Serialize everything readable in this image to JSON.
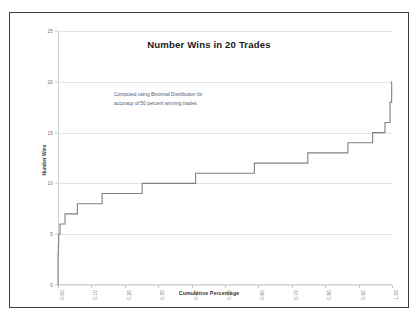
{
  "figure": {
    "background_color": "#ffffff",
    "frame_color": "#3c3c3c",
    "line_color": "#808080",
    "grid_color": "#e4e4e4",
    "annotation_color": "#4a5a7a"
  },
  "chart_data": {
    "type": "line",
    "subtype": "step",
    "title": "Number Wins in 20 Trades",
    "xlabel": "Cumulative Percentage",
    "ylabel": "Number Wins",
    "xlim": [
      0.0,
      1.0
    ],
    "ylim": [
      0,
      25
    ],
    "grid": true,
    "legend": "none",
    "xticks": [
      "0.00",
      "0.10",
      "0.20",
      "0.30",
      "0.40",
      "0.50",
      "0.60",
      "0.70",
      "0.80",
      "0.90",
      "1.00"
    ],
    "xtick_values": [
      0.0,
      0.1,
      0.2,
      0.3,
      0.4,
      0.5,
      0.6,
      0.7,
      0.8,
      0.9,
      1.0
    ],
    "yticks": [
      "0",
      "5",
      "10",
      "15",
      "20",
      "25"
    ],
    "ytick_values": [
      0,
      5,
      10,
      15,
      20,
      25
    ],
    "annotations": [
      "Computed using Binomial Distribution for",
      "accuracy of 50 percent winning trades."
    ],
    "x": [
      0.0,
      0.001,
      0.002,
      0.006,
      0.021,
      0.058,
      0.132,
      0.252,
      0.412,
      0.588,
      0.748,
      0.868,
      0.942,
      0.979,
      0.994,
      0.999,
      1.0
    ],
    "y": [
      0,
      3,
      4,
      5,
      6,
      7,
      8,
      9,
      10,
      11,
      12,
      13,
      14,
      15,
      16,
      18,
      20
    ],
    "series": [
      {
        "name": "Cumulative Wins",
        "points": [
          {
            "cumulative_percentage": 0.0,
            "number_wins": 0
          },
          {
            "cumulative_percentage": 0.001,
            "number_wins": 3
          },
          {
            "cumulative_percentage": 0.002,
            "number_wins": 4
          },
          {
            "cumulative_percentage": 0.006,
            "number_wins": 5
          },
          {
            "cumulative_percentage": 0.021,
            "number_wins": 6
          },
          {
            "cumulative_percentage": 0.058,
            "number_wins": 7
          },
          {
            "cumulative_percentage": 0.132,
            "number_wins": 8
          },
          {
            "cumulative_percentage": 0.252,
            "number_wins": 9
          },
          {
            "cumulative_percentage": 0.412,
            "number_wins": 10
          },
          {
            "cumulative_percentage": 0.588,
            "number_wins": 11
          },
          {
            "cumulative_percentage": 0.748,
            "number_wins": 12
          },
          {
            "cumulative_percentage": 0.868,
            "number_wins": 13
          },
          {
            "cumulative_percentage": 0.942,
            "number_wins": 14
          },
          {
            "cumulative_percentage": 0.979,
            "number_wins": 15
          },
          {
            "cumulative_percentage": 0.994,
            "number_wins": 16
          },
          {
            "cumulative_percentage": 0.999,
            "number_wins": 18
          },
          {
            "cumulative_percentage": 1.0,
            "number_wins": 20
          }
        ]
      }
    ]
  }
}
